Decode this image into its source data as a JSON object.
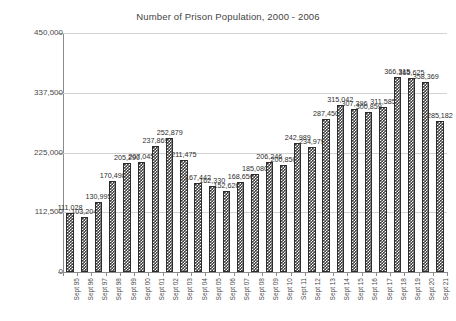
{
  "chart_data": {
    "type": "bar",
    "title": "Number of Prison Population, 2000 - 2006",
    "xlabel": "",
    "ylabel": "",
    "ylim": [
      0,
      450000
    ],
    "yticks": [
      0,
      112500,
      225000,
      337500,
      450000
    ],
    "ytick_labels": [
      "0",
      "112,500",
      "225,000",
      "337,500",
      "450,000"
    ],
    "grid": true,
    "legend": false,
    "categories": [
      "Sept 95",
      "Sept 96",
      "Sept 97",
      "Sept 98",
      "Sept 99",
      "Sept 00",
      "Sept 01",
      "Sept 02",
      "Sept 03",
      "Sept 04",
      "Sept 05",
      "Sept 06",
      "Sept 07",
      "Sept 08",
      "Sept 09",
      "Sept 10",
      "Sept 11",
      "Sept 12",
      "Sept 13",
      "Sept 14",
      "Sept 15",
      "Sept 16",
      "Sept 17",
      "Sept 18",
      "Sept 19",
      "Sept 20",
      "Sept 21"
    ],
    "values": [
      111028,
      103204,
      130995,
      170498,
      205290,
      207045,
      237869,
      252879,
      211475,
      167442,
      162330,
      152626,
      168656,
      185080,
      206246,
      200850,
      242989,
      234979,
      287450,
      315042,
      307396,
      300859,
      311585,
      366315,
      365625,
      358369,
      285182
    ],
    "value_labels": [
      "111,028",
      "103,204",
      "130,995",
      "170,498",
      "205,290",
      "207,045",
      "237,869",
      "252,879",
      "211,475",
      "167,442",
      "162,330",
      "152,626",
      "168,656",
      "185,080",
      "206,246",
      "200,850",
      "242,989",
      "234,979",
      "287,450",
      "315,042",
      "307,396",
      "300,859",
      "311,585",
      "366,315",
      "365,625",
      "358,369",
      "285,182"
    ],
    "colors": {
      "bar_fill": "#3b3b3b",
      "bar_pattern": "#ffffff",
      "bar_border": "#2c2c2c",
      "gridline": "#d2d2d2",
      "axis": "#8c8c8c",
      "text": "#3a3a3a",
      "background": "#ffffff"
    }
  }
}
